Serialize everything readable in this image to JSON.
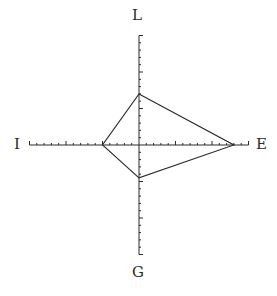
{
  "diagram": {
    "type": "four-axis kite / radar plot",
    "axes": {
      "top": {
        "label": "L"
      },
      "bottom": {
        "label": "G"
      },
      "left": {
        "label": "I"
      },
      "right": {
        "label": "E"
      }
    },
    "scale": {
      "minor_ticks_per_half_axis": 15,
      "major_every": 5
    },
    "polygon_vertices_in_ticks": {
      "L": 7,
      "E": 13,
      "G": 4.5,
      "I": 5
    },
    "colors": {
      "line": "#2a2a2a",
      "background": "#ffffff"
    }
  }
}
